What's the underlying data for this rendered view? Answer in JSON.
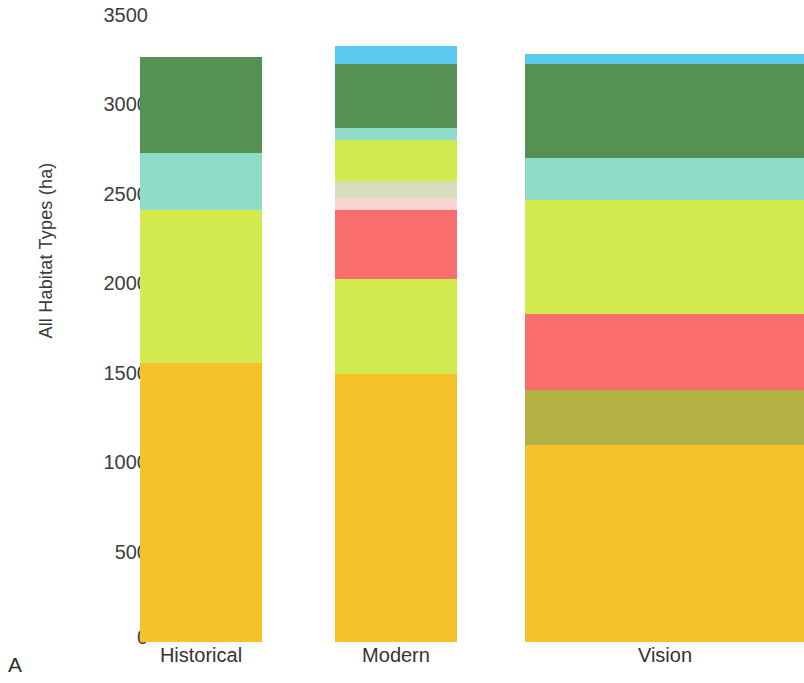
{
  "panel": {
    "letter": "A"
  },
  "axis": {
    "y_title": "All Habitat Types (ha)",
    "ticks": [
      "3500",
      "3000",
      "2500",
      "2000",
      "1500",
      "1000",
      "500",
      "0"
    ]
  },
  "categories": [
    {
      "label": "Historical"
    },
    {
      "label": "Modern"
    },
    {
      "label": "Vision"
    }
  ],
  "chart_data": {
    "type": "bar",
    "subtype": "stacked",
    "title": "",
    "xlabel": "",
    "ylabel": "All Habitat Types (ha)",
    "ylim": [
      0,
      3500
    ],
    "ytick_values": [
      0,
      500,
      1000,
      1500,
      2000,
      2500,
      3000,
      3500
    ],
    "ytick_labels": [
      "0",
      "500",
      "1000",
      "1500",
      "2000",
      "2500",
      "3000",
      "3500"
    ],
    "grid": false,
    "legend": "none",
    "categories": [
      "Historical",
      "Modern",
      "Vision"
    ],
    "series": [
      {
        "name": "habitat-orange",
        "color": "#f6c22a",
        "values": [
          1560,
          1500,
          1100
        ]
      },
      {
        "name": "habitat-olive",
        "color": "#b3b141",
        "values": [
          0,
          0,
          310
        ]
      },
      {
        "name": "habitat-yellowgreen",
        "color": "#d3ea4e",
        "values": [
          900,
          530,
          0
        ]
      },
      {
        "name": "habitat-salmon",
        "color": "#f96d6d",
        "values": [
          0,
          390,
          425
        ]
      },
      {
        "name": "habitat-palepink",
        "color": "#f8d4d4",
        "values": [
          0,
          75,
          0
        ]
      },
      {
        "name": "habitat-sage",
        "color": "#d4debb",
        "values": [
          0,
          95,
          0
        ]
      },
      {
        "name": "habitat-yellowgreen2",
        "color": "#d3ea4e",
        "values": [
          0,
          230,
          635
        ]
      },
      {
        "name": "habitat-teal",
        "color": "#8fdcc8",
        "values": [
          320,
          65,
          235
        ]
      },
      {
        "name": "habitat-darkgreen",
        "color": "#559153",
        "values": [
          535,
          345,
          525
        ]
      },
      {
        "name": "habitat-skyblue",
        "color": "#5cc8ec",
        "values": [
          0,
          100,
          55
        ]
      }
    ],
    "totals": [
      3315,
      3330,
      3285
    ]
  },
  "bars": [
    {
      "name": "Historical",
      "center_x": 201,
      "left": 140,
      "width": 122,
      "segments": [
        {
          "name": "darkgreen",
          "color": "#559153",
          "top": 57,
          "height": 96
        },
        {
          "name": "teal",
          "color": "#8fdcc8",
          "top": 153,
          "height": 57
        },
        {
          "name": "yellowgreen",
          "color": "#d3ea4e",
          "top": 210,
          "height": 153
        },
        {
          "name": "orange",
          "color": "#f6c22a",
          "top": 363,
          "height": 279
        }
      ]
    },
    {
      "name": "Modern",
      "center_x": 396,
      "left": 335,
      "width": 122,
      "segments": [
        {
          "name": "skyblue",
          "color": "#5cc8ec",
          "top": 46,
          "height": 18
        },
        {
          "name": "darkgreen",
          "color": "#559153",
          "top": 64,
          "height": 64
        },
        {
          "name": "teal",
          "color": "#8fdcc8",
          "top": 128,
          "height": 12
        },
        {
          "name": "yellowgreen",
          "color": "#d3ea4e",
          "top": 140,
          "height": 41
        },
        {
          "name": "sage",
          "color": "#d4debb",
          "top": 181,
          "height": 17
        },
        {
          "name": "palepink",
          "color": "#f8d4d4",
          "top": 198,
          "height": 12
        },
        {
          "name": "salmon",
          "color": "#f96d6d",
          "top": 210,
          "height": 69
        },
        {
          "name": "yellowgreen2",
          "color": "#d3ea4e",
          "top": 279,
          "height": 95
        },
        {
          "name": "orange",
          "color": "#f6c22a",
          "top": 374,
          "height": 268
        }
      ]
    },
    {
      "name": "Vision",
      "center_x": 665,
      "left": 525,
      "width": 279,
      "segments": [
        {
          "name": "skyblue",
          "color": "#5cc8ec",
          "top": 54,
          "height": 10
        },
        {
          "name": "darkgreen",
          "color": "#559153",
          "top": 64,
          "height": 94
        },
        {
          "name": "teal",
          "color": "#8fdcc8",
          "top": 158,
          "height": 42
        },
        {
          "name": "yellowgreen",
          "color": "#d3ea4e",
          "top": 200,
          "height": 114
        },
        {
          "name": "salmon",
          "color": "#f96d6d",
          "top": 314,
          "height": 76
        },
        {
          "name": "olive",
          "color": "#b3b141",
          "top": 390,
          "height": 55
        },
        {
          "name": "orange",
          "color": "#f6c22a",
          "top": 445,
          "height": 197
        }
      ]
    }
  ],
  "tick_positions_px": [
    15,
    104,
    194,
    283,
    373,
    462,
    552,
    637
  ],
  "baseline_y_px": 642
}
